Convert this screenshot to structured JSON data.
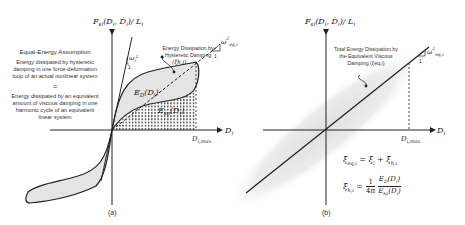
{
  "panel_a": {
    "y_axis_label": "F_si(D_i, Ḋ_i) / L_i",
    "x_axis_label": "D_i",
    "x_max_label": "D_i,max",
    "caption": "(a)",
    "assumption_title": "Equal-Energy Assumption",
    "assumption_line1": "Energy dissipated by hysteretic",
    "assumption_line2": "damping in one force-deformation",
    "assumption_line3": "loop of an actual nonlinear system",
    "equals": "=",
    "assumption_line4": "Energy dissipated by an equivalent",
    "assumption_line5": "amount of viscous damping in one",
    "assumption_line6": "harmonic cycle of an equivalent",
    "assumption_line7": "linear system",
    "hysteretic_label_line1": "Energy Dissipation by",
    "hysteretic_label_line2": "Hysteretic Damping",
    "hysteretic_symbol": "(ξh,i)",
    "ed_label": "E_D(D_i)",
    "eso_label": "E_so(D_i)",
    "initial_stiffness_label": "ω_i²",
    "eq_stiffness_label": "ω²_eq,i",
    "slope_unit": "1"
  },
  "panel_b": {
    "y_axis_label": "F_si(D_i, Ḋ_i) / L_i",
    "x_axis_label": "D_i",
    "x_max_label": "D_i,max",
    "caption": "(b)",
    "viscous_label_line1": "Total Energy Dissipation by",
    "viscous_label_line2": "the Equivalent Viscous",
    "viscous_label_line3": "Damping (ξeq,i)",
    "eq_stiffness_label": "ω²_eq,i",
    "slope_unit": "1",
    "equation1": "ξeq,i = ξi + ξh,i",
    "equation2_lhs": "ξh,i =",
    "equation2_coef": "1 / 4π",
    "equation2_num": "E_D(D_i)",
    "equation2_den": "E_so(D_i)"
  },
  "colors": {
    "line": "#222222",
    "fill": "#e6e6e6",
    "text": "#333333"
  }
}
